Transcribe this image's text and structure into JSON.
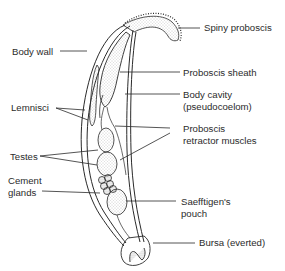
{
  "figure": {
    "labels": {
      "spiny_proboscis": "Spiny proboscis",
      "body_wall": "Body wall",
      "proboscis_sheath": "Proboscis sheath",
      "body_cavity_line1": "Body cavity",
      "body_cavity_line2": "(pseudocoelom)",
      "lemnisci": "Lemnisci",
      "proboscis_retractor_line1": "Proboscis",
      "proboscis_retractor_line2": "retractor muscles",
      "testes": "Testes",
      "cement_glands_line1": "Cement",
      "cement_glands_line2": "glands",
      "saefftigens_line1": "Saefftigen's",
      "saefftigens_line2": "pouch",
      "bursa": "Bursa (everted)"
    },
    "colors": {
      "line": "#2a2a2a",
      "stipple": "#8a8a8a",
      "background": "#ffffff"
    }
  }
}
